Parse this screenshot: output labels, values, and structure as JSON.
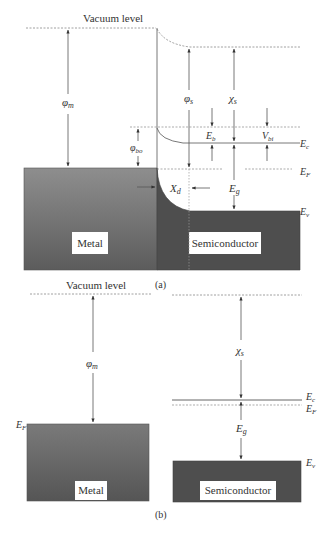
{
  "panel_a": {
    "caption": "(a)",
    "vacuum_label": "Vacuum level",
    "phi_m": "φ",
    "phi_m_sub": "m",
    "phi_s": "φ",
    "phi_s_sub": "s",
    "chi_s": "χ",
    "chi_s_sub": "s",
    "phi_bo": "φ",
    "phi_bo_sub": "bo",
    "E_b": "E",
    "E_b_sub": "b",
    "V_bi": "V",
    "V_bi_sub": "bi",
    "E_c": "E",
    "E_c_sub": "c",
    "E_F": "E",
    "E_F_sub": "F",
    "E_g": "E",
    "E_g_sub": "g",
    "E_v": "E",
    "E_v_sub": "v",
    "X_d": "X",
    "X_d_sub": "d",
    "metal_label": "Metal",
    "semiconductor_label": "Semiconductor"
  },
  "panel_b": {
    "caption": "(b)",
    "vacuum_label": "Vacuum level",
    "phi_m": "φ",
    "phi_m_sub": "m",
    "chi_s": "χ",
    "chi_s_sub": "s",
    "E_c": "E",
    "E_c_sub": "c",
    "E_F_semi": "E",
    "E_F_semi_sub": "F",
    "E_F_metal": "E",
    "E_F_metal_sub": "F",
    "E_g": "E",
    "E_g_sub": "g",
    "E_v": "E",
    "E_v_sub": "v",
    "metal_label": "Metal",
    "semiconductor_label": "Semiconductor"
  },
  "colors": {
    "line": "#666666",
    "dashed": "#888888",
    "metal_top": "#8a8a8a",
    "metal_bottom": "#5a5a5a",
    "semiconductor": "#4a4a4a",
    "label_box": "#ffffff"
  }
}
